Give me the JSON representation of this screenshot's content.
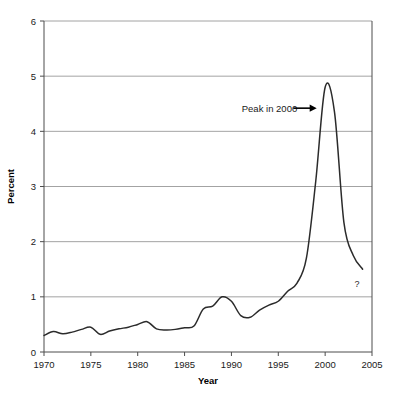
{
  "chart_data": {
    "type": "line",
    "title": "",
    "xlabel": "Year",
    "ylabel": "Percent",
    "xlim": [
      1970,
      2005
    ],
    "ylim": [
      0,
      6
    ],
    "grid": "horizontal",
    "legend": "none",
    "x_ticks": [
      "1970",
      "1975",
      "1980",
      "1985",
      "1990",
      "1995",
      "2000",
      "2005"
    ],
    "x_tick_values": [
      1970,
      1975,
      1980,
      1985,
      1990,
      1995,
      2000,
      2005
    ],
    "y_ticks": [
      "0",
      "1",
      "2",
      "3",
      "4",
      "5",
      "6"
    ],
    "y_tick_values": [
      0,
      1,
      2,
      3,
      4,
      5,
      6
    ],
    "series": [
      {
        "name": "Percent",
        "color": "#2b2b2b",
        "x": [
          1970,
          1971,
          1972,
          1973,
          1974,
          1975,
          1976,
          1977,
          1978,
          1979,
          1980,
          1981,
          1982,
          1983,
          1984,
          1985,
          1986,
          1987,
          1988,
          1989,
          1990,
          1991,
          1992,
          1993,
          1994,
          1995,
          1996,
          1997,
          1998,
          1999,
          2000,
          2001,
          2002,
          2003,
          2004
        ],
        "values": [
          0.3,
          0.37,
          0.33,
          0.36,
          0.41,
          0.45,
          0.32,
          0.38,
          0.42,
          0.45,
          0.5,
          0.55,
          0.42,
          0.4,
          0.41,
          0.44,
          0.47,
          0.78,
          0.83,
          1.0,
          0.92,
          0.66,
          0.63,
          0.76,
          0.85,
          0.92,
          1.1,
          1.25,
          1.7,
          3.1,
          4.8,
          4.35,
          2.35,
          1.75,
          1.5
        ]
      }
    ],
    "annotations": [
      {
        "name": "peak-annotation",
        "text": "Peak in 2000",
        "text_x": 1991.1,
        "text_y": 4.42,
        "arrow_from_x": 1996.6,
        "arrow_from_y": 4.42,
        "arrow_to_x": 1999.1,
        "arrow_to_y": 4.42
      },
      {
        "name": "question-mark-annotation",
        "text": "?",
        "text_x": 2003.4,
        "text_y": 1.18
      }
    ],
    "peak": {
      "year": 2000,
      "value": 4.8
    }
  },
  "axes": {
    "plot_left_px": 44,
    "plot_right_px": 372,
    "plot_top_px": 21,
    "plot_bottom_px": 352
  }
}
